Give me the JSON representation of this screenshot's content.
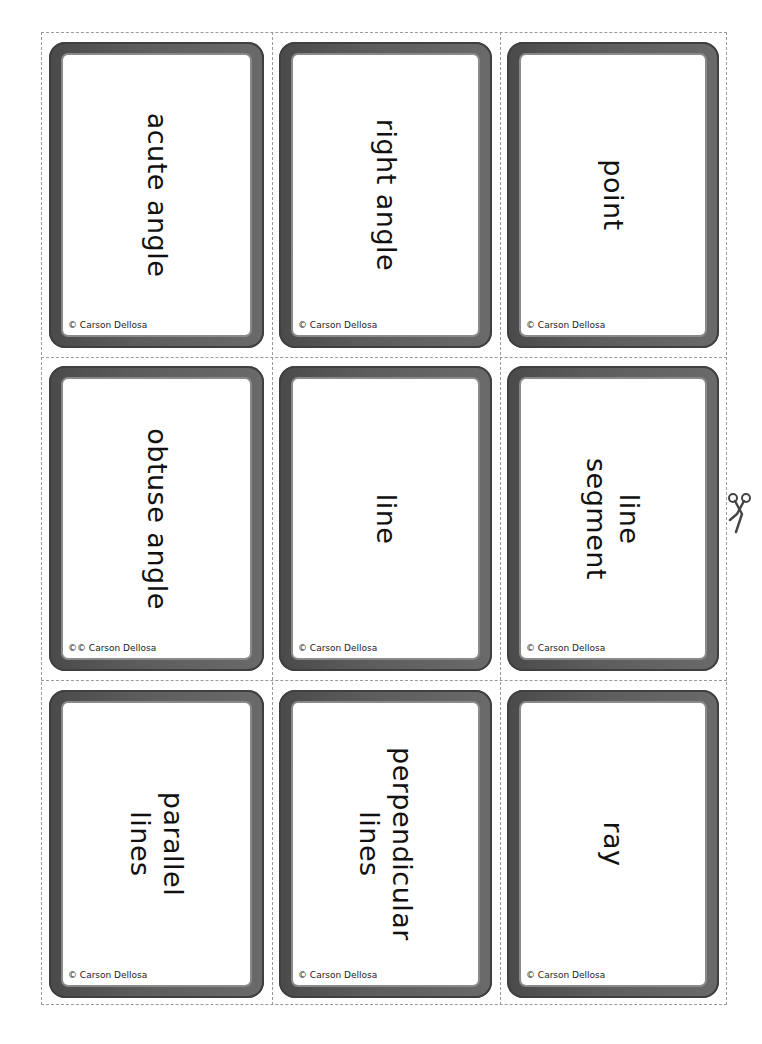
{
  "sheet": {
    "cut_line_style": "dashed",
    "frame_color": "#555555",
    "cards": [
      {
        "lines": [
          "acute angle"
        ],
        "copyright": "© Carson Dellosa"
      },
      {
        "lines": [
          "right angle"
        ],
        "copyright": "© Carson Dellosa"
      },
      {
        "lines": [
          "point"
        ],
        "copyright": "© Carson Dellosa"
      },
      {
        "lines": [
          "obtuse angle"
        ],
        "copyright": "©© Carson Dellosa"
      },
      {
        "lines": [
          "line"
        ],
        "copyright": "© Carson Dellosa"
      },
      {
        "lines": [
          "line",
          "segment"
        ],
        "copyright": "© Carson Dellosa"
      },
      {
        "lines": [
          "parallel",
          "lines"
        ],
        "copyright": "© Carson Dellosa"
      },
      {
        "lines": [
          "perpendicular",
          "lines"
        ],
        "copyright": "© Carson Dellosa"
      },
      {
        "lines": [
          "ray"
        ],
        "copyright": "© Carson Dellosa"
      }
    ]
  },
  "icons": {
    "scissors": "scissors-icon"
  }
}
